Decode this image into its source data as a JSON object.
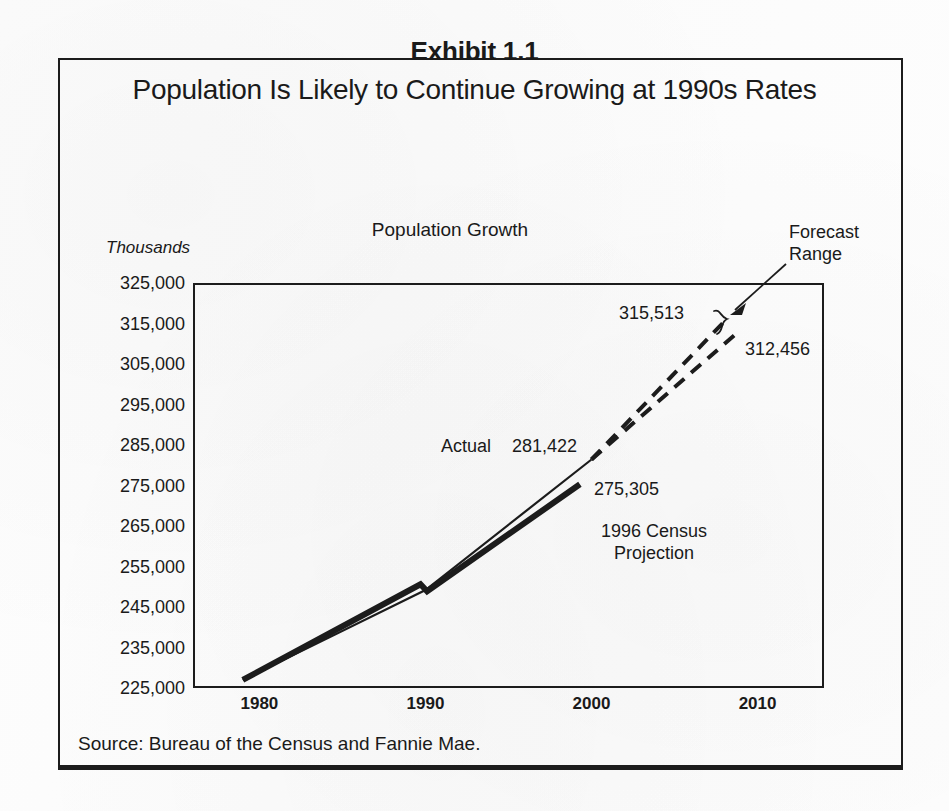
{
  "exhibit": {
    "number": "Exhibit 1.1",
    "title": "Population Is Likely to Continue Growing at 1990s Rates",
    "source": "Source: Bureau of the Census and Fannie Mae."
  },
  "chart_data": {
    "type": "line",
    "title": "Population Growth",
    "xlabel": "",
    "ylabel": "Thousands",
    "xlim": [
      1976,
      2014
    ],
    "ylim": [
      225000,
      325000
    ],
    "grid": false,
    "legend": "none",
    "xticks": [
      "1980",
      "1990",
      "2000",
      "2010"
    ],
    "xtick_values": [
      1980,
      1990,
      2000,
      2010
    ],
    "yticks": [
      "225,000",
      "235,000",
      "245,000",
      "255,000",
      "265,000",
      "275,000",
      "285,000",
      "295,000",
      "305,000",
      "315,000",
      "325,000"
    ],
    "ytick_values": [
      225000,
      235000,
      245000,
      255000,
      265000,
      275000,
      285000,
      295000,
      305000,
      315000,
      325000
    ],
    "series": [
      {
        "name": "Actual",
        "style": "thin-solid",
        "x": [
          1979.0,
          1990.0,
          2000.0
        ],
        "values": [
          227000,
          249200,
          281422
        ]
      },
      {
        "name": "1996 Census Projection",
        "style": "thick-solid",
        "x": [
          1979.0,
          1989.7,
          1990.1,
          1999.3
        ],
        "values": [
          227000,
          250600,
          248900,
          275305
        ]
      },
      {
        "name": "Forecast Range High",
        "style": "dashed",
        "x": [
          2000.0,
          2008.0
        ],
        "values": [
          281422,
          315513
        ]
      },
      {
        "name": "Forecast Range Low",
        "style": "dashed",
        "x": [
          2000.0,
          2008.7
        ],
        "values": [
          281422,
          312456
        ]
      }
    ],
    "annotations": [
      {
        "text": "Actual",
        "x": 1994.0,
        "y": 286000
      },
      {
        "text": "281,422",
        "x": 1996.5,
        "y": 286000
      },
      {
        "text": "275,305",
        "x": 2001.0,
        "y": 275305
      },
      {
        "text": "1996 Census\nProjection",
        "x": 2001.5,
        "y": 264000
      },
      {
        "text": "315,513",
        "x": 2005.0,
        "y": 316000
      },
      {
        "text": "312,456",
        "x": 2009.5,
        "y": 309000
      },
      {
        "text": "Forecast Range",
        "x": 2012.0,
        "y": 328000
      }
    ],
    "annotation_labels": {
      "actual": "Actual",
      "actual_value": "281,422",
      "census_value": "275,305",
      "census_projection": "1996 Census Projection",
      "forecast_high": "315,513",
      "forecast_low": "312,456",
      "forecast_range": "Forecast Range"
    }
  },
  "colors": {
    "ink": "#1c1c1c",
    "paper": "#fdfdfd"
  }
}
